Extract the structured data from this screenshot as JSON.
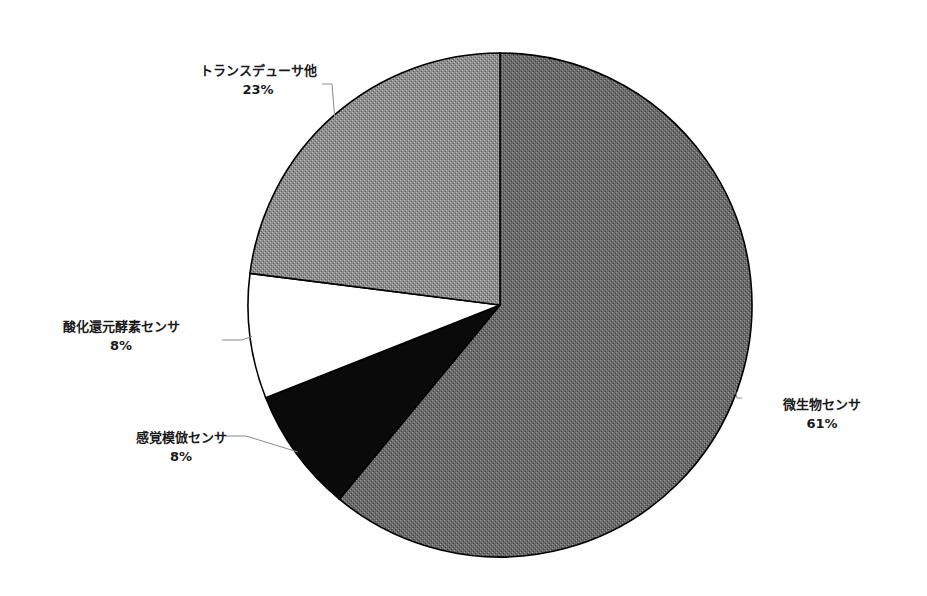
{
  "chart_data": {
    "type": "pie",
    "title": "",
    "start_angle_deg": 0,
    "direction": "clockwise",
    "slices": [
      {
        "label": "微生物センサ",
        "value": 61,
        "value_label": "61%",
        "color": "#6e6e6e",
        "texture": "dark-stipple"
      },
      {
        "label": "感覚模倣センサ",
        "value": 8,
        "value_label": "8%",
        "color": "#0a0a0a",
        "texture": "none"
      },
      {
        "label": "酸化還元酵素センサ",
        "value": 8,
        "value_label": "8%",
        "color": "#ffffff",
        "texture": "none"
      },
      {
        "label": "トランスデューサ他",
        "value": 23,
        "value_label": "23%",
        "color": "#8c8c8c",
        "texture": "light-stipple"
      }
    ],
    "legend": "none",
    "units": "percent"
  }
}
